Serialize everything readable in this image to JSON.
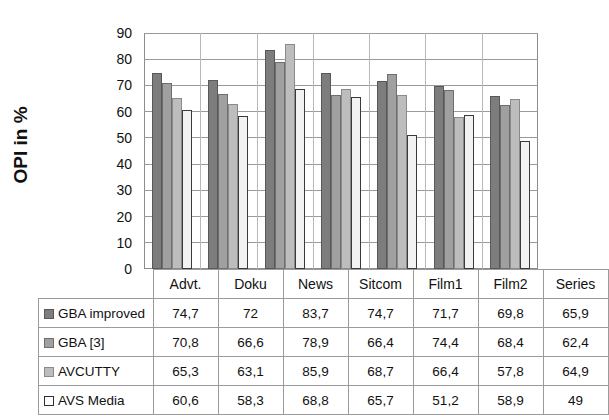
{
  "chart_data": {
    "type": "bar",
    "title": "",
    "xlabel": "",
    "ylabel": "OPI in %",
    "ylim": [
      0,
      90
    ],
    "yticks": [
      90,
      80,
      70,
      60,
      50,
      40,
      30,
      20,
      10,
      0
    ],
    "grid": true,
    "legend_position": "table-left",
    "categories": [
      "Advt.",
      "Doku",
      "News",
      "Sitcom",
      "Film1",
      "Film2",
      "Series"
    ],
    "series": [
      {
        "name": "GBA improved",
        "swatch": "#7d7d7d",
        "values": [
          74.7,
          72,
          83.7,
          74.7,
          71.7,
          69.8,
          65.9
        ],
        "labels": [
          "74,7",
          "72",
          "83,7",
          "74,7",
          "71,7",
          "69,8",
          "65,9"
        ]
      },
      {
        "name": "GBA [3]",
        "swatch": "#a0a0a0",
        "values": [
          70.8,
          66.6,
          78.9,
          66.4,
          74.4,
          68.4,
          62.4
        ],
        "labels": [
          "70,8",
          "66,6",
          "78,9",
          "66,4",
          "74,4",
          "68,4",
          "62,4"
        ]
      },
      {
        "name": "AVCUTTY",
        "swatch": "#bdbdbd",
        "values": [
          65.3,
          63.1,
          85.9,
          68.7,
          66.4,
          57.8,
          64.9
        ],
        "labels": [
          "65,3",
          "63,1",
          "85,9",
          "68,7",
          "66,4",
          "57,8",
          "64,9"
        ]
      },
      {
        "name": "AVS Media",
        "swatch": "#ffffff",
        "values": [
          60.6,
          58.3,
          68.8,
          65.7,
          51.2,
          58.9,
          49
        ],
        "labels": [
          "60,6",
          "58,3",
          "68,8",
          "65,7",
          "51,2",
          "58,9",
          "49"
        ]
      }
    ]
  },
  "table": {
    "corner_label": "",
    "column_headers": [
      "Advt.",
      "Doku",
      "News",
      "Sitcom",
      "Film1",
      "Film2",
      "Series"
    ],
    "rows": [
      {
        "label": "GBA improved",
        "swatch_class": "s0",
        "values": [
          "74,7",
          "72",
          "83,7",
          "74,7",
          "71,7",
          "69,8",
          "65,9"
        ]
      },
      {
        "label": "GBA [3]",
        "swatch_class": "s1",
        "values": [
          "70,8",
          "66,6",
          "78,9",
          "66,4",
          "74,4",
          "68,4",
          "62,4"
        ]
      },
      {
        "label": "AVCUTTY",
        "swatch_class": "s2",
        "values": [
          "65,3",
          "63,1",
          "85,9",
          "68,7",
          "66,4",
          "57,8",
          "64,9"
        ]
      },
      {
        "label": "AVS Media",
        "swatch_class": "s3",
        "values": [
          "60,6",
          "58,3",
          "68,8",
          "65,7",
          "51,2",
          "58,9",
          "49"
        ]
      }
    ]
  },
  "colors": {
    "series0": "#7d7d7d",
    "series1": "#a0a0a0",
    "series2": "#bdbdbd",
    "series3": "#ffffff",
    "grid": "#9a9a9a",
    "frame": "#8c8c8c",
    "background": "#ffffff"
  }
}
